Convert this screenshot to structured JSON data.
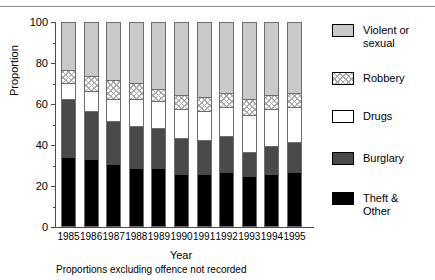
{
  "chart_data": {
    "type": "bar",
    "subtype": "stacked-bar-100pct",
    "title": "",
    "xlabel": "Year",
    "ylabel": "Proportion",
    "ylim": [
      0,
      100
    ],
    "yticks": [
      0,
      20,
      40,
      60,
      80,
      100
    ],
    "ytick_labels": [
      "0",
      "20",
      "40",
      "60",
      "80",
      "100"
    ],
    "y_minor_ticks": [
      10,
      30,
      50,
      70,
      90
    ],
    "grid": false,
    "legend_position": "right",
    "stack_order_bottom_to_top": [
      "Theft & Other",
      "Burglary",
      "Drugs",
      "Robbery",
      "Violent or sexual"
    ],
    "categories": [
      "1985",
      "1986",
      "1987",
      "1988",
      "1989",
      "1990",
      "1991",
      "1992",
      "1993",
      "1994",
      "1995"
    ],
    "series": [
      {
        "name": "Theft & Other",
        "values": [
          33,
          32,
          30,
          28,
          28,
          25,
          25,
          26,
          24,
          25,
          26
        ]
      },
      {
        "name": "Burglary",
        "values": [
          29,
          24,
          21,
          21,
          20,
          18,
          17,
          18,
          12,
          14,
          15
        ]
      },
      {
        "name": "Drugs",
        "values": [
          8,
          10,
          11,
          13,
          13,
          14,
          14,
          14,
          18,
          18,
          17
        ]
      },
      {
        "name": "Robbery",
        "values": [
          6,
          7,
          9,
          8,
          6,
          7,
          7,
          7,
          8,
          7,
          7
        ]
      },
      {
        "name": "Violent or sexual",
        "values": [
          24,
          27,
          29,
          30,
          33,
          36,
          37,
          35,
          38,
          36,
          35
        ]
      }
    ],
    "cumulative_tops": [
      [
        33,
        62,
        70,
        76,
        100
      ],
      [
        32,
        56,
        66,
        73,
        100
      ],
      [
        30,
        51,
        62,
        71,
        100
      ],
      [
        28,
        49,
        62,
        70,
        100
      ],
      [
        28,
        48,
        61,
        67,
        100
      ],
      [
        25,
        43,
        57,
        64,
        100
      ],
      [
        25,
        42,
        56,
        63,
        100
      ],
      [
        26,
        44,
        58,
        65,
        100
      ],
      [
        24,
        36,
        54,
        62,
        100
      ],
      [
        25,
        39,
        57,
        64,
        100
      ],
      [
        26,
        41,
        58,
        65,
        100
      ]
    ],
    "annotations": [
      "Proportions excluding offence not recorded"
    ]
  },
  "axes": {
    "ylabel": "Proportion",
    "xlabel": "Year",
    "ytick_labels": [
      "100",
      "80",
      "60",
      "40",
      "20",
      "0"
    ],
    "xtick_labels": [
      "1985",
      "1986",
      "1987",
      "1988",
      "1989",
      "1990",
      "1991",
      "1992",
      "1993",
      "1994",
      "1995"
    ]
  },
  "legend": {
    "items": [
      {
        "label": "Violent or\nsexual",
        "swatch": "solid-light-grey",
        "color": "#c9c9c9"
      },
      {
        "label": "Robbery",
        "swatch": "diagonal-hatch",
        "color": "#a8a8a8"
      },
      {
        "label": "Drugs",
        "swatch": "solid-white",
        "color": "#ffffff"
      },
      {
        "label": "Burglary",
        "swatch": "solid-dark-grey",
        "color": "#4a4a4a"
      },
      {
        "label": "Theft &\nOther",
        "swatch": "solid-black",
        "color": "#000000"
      }
    ]
  },
  "footnote": "Proportions excluding offence not recorded"
}
